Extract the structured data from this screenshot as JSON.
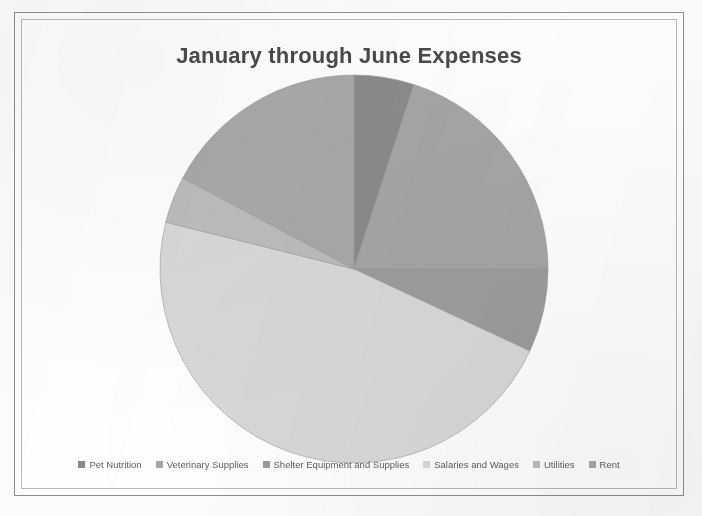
{
  "chart_title": "January through June Expenses",
  "colors": {
    "frame_outer": "#8d8d8d",
    "frame_inner": "#b9b9b9",
    "title_text": "#4a4a4a",
    "legend_text": "#5d5d5d",
    "background": "#ffffff",
    "slice_edge": "#9a9a9a"
  },
  "legend": {
    "position": "bottom",
    "items": [
      {
        "label": "Pet Nutrition",
        "color": "#8b8b8b"
      },
      {
        "label": "Veterinary Supplies",
        "color": "#a6a6a6"
      },
      {
        "label": "Shelter Equipment and Supplies",
        "color": "#9d9d9d"
      },
      {
        "label": "Salaries and Wages",
        "color": "#d9d9d9"
      },
      {
        "label": "Utilities",
        "color": "#bdbdbd"
      },
      {
        "label": "Rent",
        "color": "#a9a9a9"
      }
    ]
  },
  "chart_data": {
    "type": "pie",
    "title": "January through June Expenses",
    "xlabel": "",
    "ylabel": "",
    "legend_position": "bottom",
    "grid": false,
    "start_angle_deg": 0,
    "direction": "clockwise",
    "categories": [
      "Pet Nutrition",
      "Veterinary Supplies",
      "Shelter Equipment and Supplies",
      "Salaries and Wages",
      "Utilities",
      "Rent"
    ],
    "values": [
      5,
      20,
      7,
      47,
      4,
      17
    ],
    "slices": [
      {
        "label": "Pet Nutrition",
        "value": 5,
        "percent": 5,
        "color": "#8b8b8b",
        "start_deg": 0,
        "end_deg": 18
      },
      {
        "label": "Veterinary Supplies",
        "value": 20,
        "percent": 20,
        "color": "#a6a6a6",
        "start_deg": 18,
        "end_deg": 90
      },
      {
        "label": "Shelter Equipment and Supplies",
        "value": 7,
        "percent": 7,
        "color": "#9d9d9d",
        "start_deg": 90,
        "end_deg": 115
      },
      {
        "label": "Salaries and Wages",
        "value": 47,
        "percent": 47,
        "color": "#d9d9d9",
        "start_deg": 115,
        "end_deg": 284
      },
      {
        "label": "Utilities",
        "value": 4,
        "percent": 4,
        "color": "#bdbdbd",
        "start_deg": 284,
        "end_deg": 298
      },
      {
        "label": "Rent",
        "value": 17,
        "percent": 17,
        "color": "#a9a9a9",
        "start_deg": 298,
        "end_deg": 360
      }
    ],
    "geometry": {
      "center_x": 198,
      "center_y": 198,
      "radius": 194
    }
  }
}
